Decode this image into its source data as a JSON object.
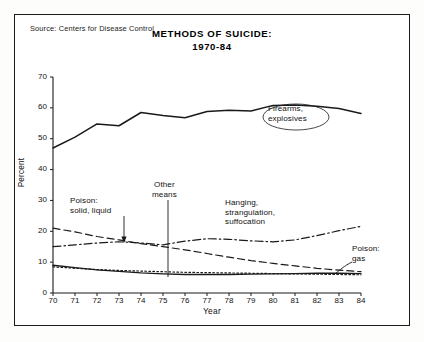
{
  "source": "Source: Centers for Disease Control",
  "title_line1": "METHODS OF SUICIDE:",
  "title_line2": "1970-84",
  "axes": {
    "ylabel": "Percent",
    "xlabel": "Year",
    "yticks": [
      "0",
      "10",
      "20",
      "30",
      "40",
      "50",
      "60",
      "70"
    ],
    "xticks": [
      "70",
      "71",
      "72",
      "73",
      "74",
      "75",
      "76",
      "77",
      "78",
      "79",
      "80",
      "81",
      "82",
      "83",
      "84"
    ]
  },
  "annotations": {
    "firearms": "Firearms,\nexplosives",
    "firearms_l1": "Firearms,",
    "firearms_l2": "explosives",
    "poison_solid_l1": "Poison:",
    "poison_solid_l2": "solid, liquid",
    "other_l1": "Other",
    "other_l2": "means",
    "hanging_l1": "Hanging,",
    "hanging_l2": "strangulation,",
    "hanging_l3": "suffocation",
    "poison_gas_l1": "Poison:",
    "poison_gas_l2": "gas"
  },
  "colors": {
    "ink": "#1a1a1a",
    "paper": "#ffffff",
    "frame": "#1a1a1a"
  },
  "chart_data": {
    "type": "line",
    "title": "METHODS OF SUICIDE: 1970-84",
    "xlabel": "Year",
    "ylabel": "Percent",
    "xlim": [
      70,
      84
    ],
    "ylim": [
      0,
      70
    ],
    "grid": false,
    "legend": "inline-annotations",
    "x": [
      70,
      71,
      72,
      73,
      74,
      75,
      76,
      77,
      78,
      79,
      80,
      81,
      82,
      83,
      84
    ],
    "series": [
      {
        "name": "Firearms, explosives",
        "style": "solid",
        "values": [
          47.0,
          50.5,
          54.8,
          54.2,
          58.5,
          57.5,
          56.8,
          58.8,
          59.2,
          59.0,
          60.8,
          60.9,
          60.5,
          59.8,
          58.2
        ]
      },
      {
        "name": "Poison: solid, liquid",
        "style": "dashed",
        "values": [
          21.0,
          19.8,
          18.3,
          17.2,
          16.0,
          15.0,
          14.0,
          12.8,
          11.6,
          10.5,
          9.6,
          8.8,
          8.0,
          7.4,
          6.9
        ]
      },
      {
        "name": "Hanging, strangulation, suffocation",
        "style": "dash-dot",
        "values": [
          15.0,
          15.6,
          16.2,
          16.6,
          16.2,
          15.6,
          16.8,
          17.6,
          17.4,
          16.9,
          16.6,
          17.2,
          18.6,
          20.2,
          21.6
        ]
      },
      {
        "name": "Poison: gas",
        "style": "solid-thin",
        "values": [
          9.0,
          8.2,
          7.5,
          7.0,
          6.5,
          6.2,
          6.0,
          6.0,
          6.0,
          6.1,
          6.2,
          6.3,
          6.4,
          6.4,
          6.3
        ]
      },
      {
        "name": "Other means",
        "style": "dotted",
        "values": [
          8.5,
          8.0,
          7.6,
          7.3,
          7.1,
          6.9,
          6.7,
          6.6,
          6.5,
          6.4,
          6.3,
          6.2,
          6.1,
          6.0,
          5.9
        ]
      }
    ]
  }
}
